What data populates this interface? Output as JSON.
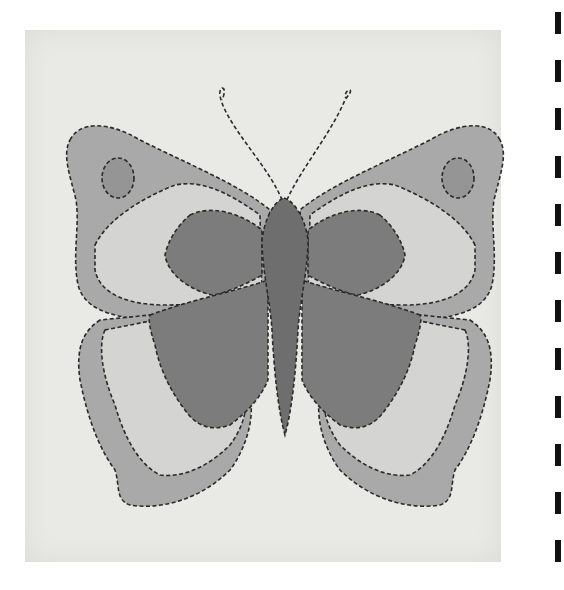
{
  "image": {
    "subject": "Quilted butterfly appliqué on fabric square",
    "style": "grayscale photograph",
    "colors": {
      "background": "#ffffff",
      "fabric": "#e9e9e6",
      "outer_wing": "#a9a9a9",
      "inner_wing_light": "#d4d4d2",
      "inner_wing_dark": "#7c7c7c",
      "body": "#6e6e6e",
      "spot": "#959595",
      "stitch": "#2a2a2a"
    }
  }
}
